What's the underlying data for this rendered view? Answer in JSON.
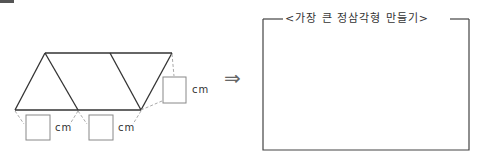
{
  "problem": {
    "figure": {
      "shape": "parallelogram-strip of 3 equilateral triangles",
      "triangles": 3,
      "answer_boxes": [
        {
          "id": "bottom-left",
          "value": "",
          "unit": "cm"
        },
        {
          "id": "bottom-middle",
          "value": "",
          "unit": "cm"
        },
        {
          "id": "right-side",
          "value": "",
          "unit": "cm"
        }
      ]
    },
    "arrow_icon": "double-right-arrow",
    "arrow_glyph": "⇒",
    "result_panel": {
      "title": "<가장 큰 정삼각형 만들기>",
      "content": ""
    }
  },
  "colors": {
    "line": "#333333",
    "dashed": "#999999",
    "box": "#888888"
  }
}
